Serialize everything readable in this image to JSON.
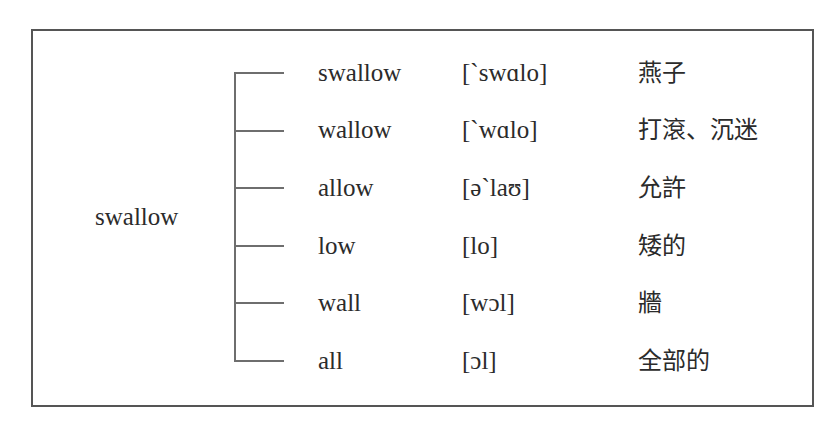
{
  "diagram": {
    "root": "swallow",
    "line_color": "#6e6e6e",
    "border_color": "#555555",
    "rows": [
      {
        "word": "swallow",
        "ipa": "[`swɑlo]",
        "meaning": "燕子"
      },
      {
        "word": "wallow",
        "ipa": "[`wɑlo]",
        "meaning": "打滾、沉迷"
      },
      {
        "word": "allow",
        "ipa": "[ə`laʊ]",
        "meaning": "允許"
      },
      {
        "word": "low",
        "ipa": "[lo]",
        "meaning": "矮的"
      },
      {
        "word": "wall",
        "ipa": "[wɔl]",
        "meaning": "牆"
      },
      {
        "word": "all",
        "ipa": "[ɔl]",
        "meaning": "全部的"
      }
    ]
  }
}
